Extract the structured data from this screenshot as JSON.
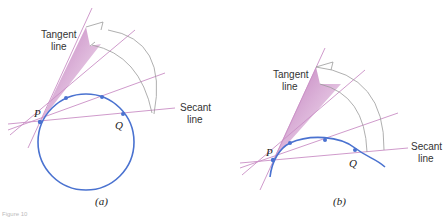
{
  "figure": {
    "caption_fragment": "Figure 10",
    "colors": {
      "curve": "#4a72d0",
      "lines": "#c98fc5",
      "wedge": "#b566b0",
      "arrow": "#999999"
    },
    "panels": [
      {
        "id": "a",
        "caption": "(a)",
        "curve_type": "circle",
        "point_p_label": "P",
        "point_q_label": "Q",
        "tangent_label_line1": "Tangent",
        "tangent_label_line2": "line",
        "secant_label_line1": "Secant",
        "secant_label_line2": "line"
      },
      {
        "id": "b",
        "caption": "(b)",
        "curve_type": "curve",
        "point_p_label": "P",
        "point_q_label": "Q",
        "tangent_label_line1": "Tangent",
        "tangent_label_line2": "line",
        "secant_label_line1": "Secant",
        "secant_label_line2": "line"
      }
    ]
  }
}
